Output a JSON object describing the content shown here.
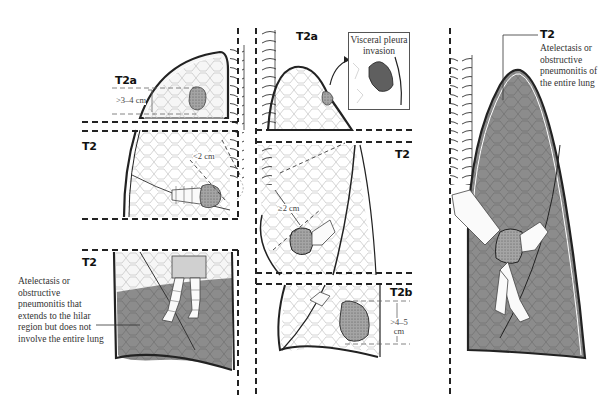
{
  "figure": {
    "colors": {
      "line": "#222222",
      "lung_fill": "#f4f4f4",
      "collapsed_fill": "#8f8f8f",
      "tumor_fill": "#9a9a9a",
      "dash": "#222222"
    }
  },
  "panel_left": {
    "top": {
      "stage_label": "T2a",
      "measurement": ">3–4 cm"
    },
    "middle": {
      "stage_label": "T2",
      "measurement": "<2 cm"
    },
    "bottom": {
      "stage_label": "T2",
      "note": "Atelectasis or obstructive pneumonitis that extends to the hilar region but does not involve the entire lung"
    }
  },
  "panel_center": {
    "top": {
      "stage_label": "T2a",
      "callout_title": "Visceral pleura invasion"
    },
    "middle": {
      "stage_label": "T2",
      "measurement": "≥2 cm"
    },
    "bottom": {
      "stage_label": "T2b",
      "measurement_line1": ">4–5",
      "measurement_line2": "cm"
    }
  },
  "panel_right": {
    "stage_label": "T2",
    "note": "Atelectasis or obstructive pneumonitis of the entire lung"
  }
}
